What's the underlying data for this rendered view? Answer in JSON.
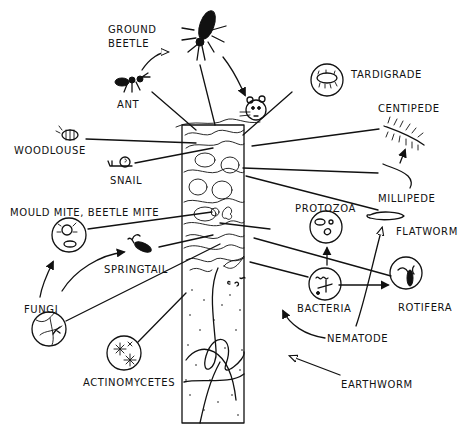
{
  "diagram": {
    "title": "",
    "type": "soil food web illustration",
    "colors": {
      "ink": "#111111",
      "background": "#ffffff"
    },
    "labels": [
      {
        "id": "ground-beetle",
        "text_lines": [
          "GROUND",
          "BEETLE"
        ]
      },
      {
        "id": "ant",
        "text": "ANT"
      },
      {
        "id": "tardigrade",
        "text": "TARDIGRADE"
      },
      {
        "id": "centipede",
        "text": "CENTIPEDE"
      },
      {
        "id": "woodlouse",
        "text": "WOODLOUSE"
      },
      {
        "id": "snail",
        "text": "SNAIL"
      },
      {
        "id": "millipede",
        "text": "MILLIPEDE"
      },
      {
        "id": "mould-mite",
        "text": "MOULD MITE, BEETLE MITE"
      },
      {
        "id": "protozoa",
        "text": "PROTOZOA"
      },
      {
        "id": "flatworm",
        "text": "FLATWORM"
      },
      {
        "id": "springtail",
        "text": "SPRINGTAIL"
      },
      {
        "id": "fungi",
        "text": "FUNGI"
      },
      {
        "id": "bacteria",
        "text": "BACTERIA"
      },
      {
        "id": "rotifera",
        "text": "ROTIFERA"
      },
      {
        "id": "nematode",
        "text": "NEMATODE"
      },
      {
        "id": "actinomycetes",
        "text": "ACTINOMYCETES"
      },
      {
        "id": "earthworm",
        "text": "EARTHWORM"
      }
    ],
    "feeding_arrows": [
      {
        "from": "ant",
        "to": "ground-beetle"
      },
      {
        "from": "ground-beetle",
        "to": "shrew"
      },
      {
        "from": "millipede",
        "to": "centipede"
      },
      {
        "from": "fungi",
        "to": "mould-mite"
      },
      {
        "from": "fungi",
        "to": "springtail"
      },
      {
        "from": "bacteria",
        "to": "protozoa"
      },
      {
        "from": "bacteria",
        "to": "rotifera"
      },
      {
        "from": "nematode",
        "to": "flatworm"
      }
    ]
  }
}
